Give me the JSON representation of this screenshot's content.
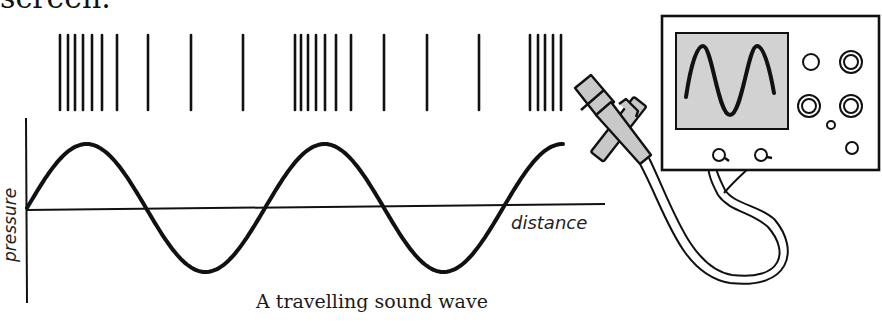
{
  "header_fragment": "screen.",
  "diagram": {
    "caption": "A travelling sound wave",
    "x_axis_label": "distance",
    "y_axis_label": "pressure",
    "compression_lines_x": [
      60,
      68,
      75,
      83,
      92,
      102,
      117,
      148,
      191,
      243,
      295,
      301,
      308,
      316,
      325,
      336,
      351,
      384,
      427,
      479,
      530,
      538,
      545,
      553,
      561
    ],
    "wave": {
      "axis_y": 208,
      "amplitude": 64,
      "start_x": 27,
      "wavelength": 238,
      "end_x": 563
    },
    "oscilloscope": {
      "screen_color": "#d2d2d2",
      "knobs": [
        {
          "cx": 811,
          "cy": 62,
          "r": 8,
          "double": false
        },
        {
          "cx": 851,
          "cy": 62,
          "r": 11,
          "double": true
        },
        {
          "cx": 809,
          "cy": 106,
          "r": 11,
          "double": true
        },
        {
          "cx": 851,
          "cy": 106,
          "r": 11,
          "double": true
        },
        {
          "cx": 831,
          "cy": 125,
          "r": 4,
          "double": false
        },
        {
          "cx": 852,
          "cy": 148,
          "r": 6,
          "double": false
        }
      ]
    },
    "colors": {
      "ink": "#111111",
      "screen": "#d2d2d2",
      "mic": "#c8c8c8"
    }
  }
}
